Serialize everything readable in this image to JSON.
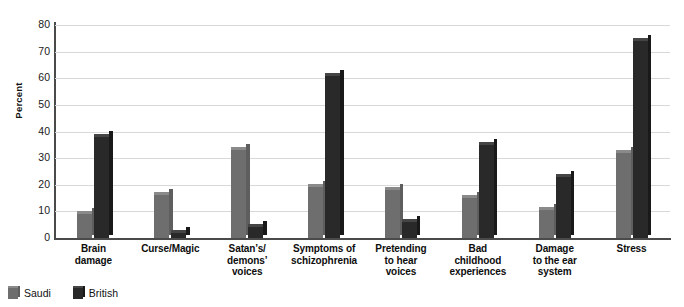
{
  "chart_data": {
    "type": "bar",
    "title": "",
    "xlabel": "",
    "ylabel": "Percent",
    "ylim": [
      0,
      80
    ],
    "yticks": [
      0,
      10,
      20,
      30,
      40,
      50,
      60,
      70,
      80
    ],
    "grid": true,
    "legend_position": "bottom-left",
    "categories": [
      "Brain damage",
      "Curse/Magic",
      "Satan’s/ demons’ voices",
      "Symptoms of schizophrenia",
      "Pretending to hear voices",
      "Bad childhood experiences",
      "Damage to the ear system",
      "Stress"
    ],
    "category_lines": [
      [
        "Brain",
        "damage"
      ],
      [
        "Curse/Magic"
      ],
      [
        "Satan’s/",
        "demons’",
        "voices"
      ],
      [
        "Symptoms of",
        "schizophrenia"
      ],
      [
        "Pretending",
        "to hear",
        "voices"
      ],
      [
        "Bad",
        "childhood",
        "experiences"
      ],
      [
        "Damage",
        "to the ear",
        "system"
      ],
      [
        "Stress"
      ]
    ],
    "series": [
      {
        "name": "Saudi",
        "color": "#6e6e6e",
        "values": [
          9,
          16,
          33,
          19,
          18,
          15,
          10.5,
          32
        ]
      },
      {
        "name": "British",
        "color": "#292929",
        "values": [
          38,
          2,
          4,
          61,
          6,
          35,
          23,
          74
        ]
      }
    ]
  },
  "legend": {
    "items": [
      {
        "label": "Saudi"
      },
      {
        "label": "British"
      }
    ]
  },
  "axes": {
    "y_title": "Percent"
  }
}
